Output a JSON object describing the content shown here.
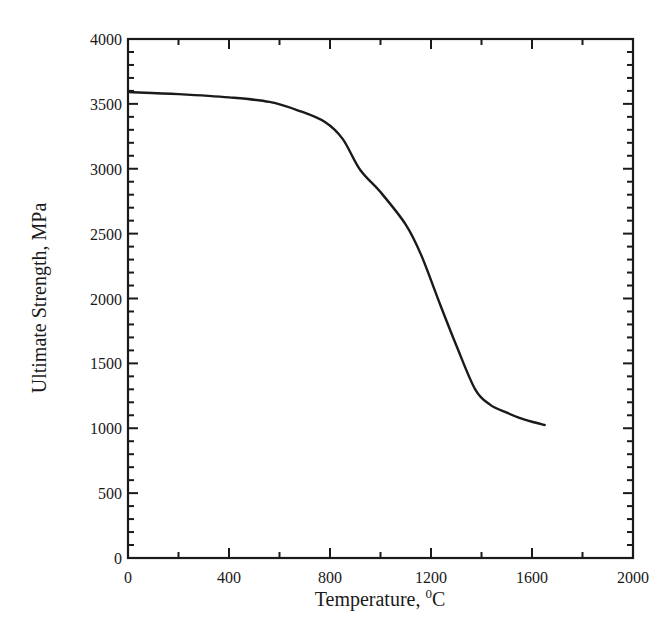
{
  "chart_data": {
    "type": "line",
    "title": "",
    "xlabel": "Temperature, °C",
    "xlabel_main": "Temperature, ",
    "xlabel_sup": "0",
    "xlabel_unit": "C",
    "ylabel": "Ultimate Strength, MPa",
    "xlim": [
      0,
      2000
    ],
    "ylim": [
      0,
      4000
    ],
    "x_ticks": [
      0,
      400,
      800,
      1200,
      1600,
      2000
    ],
    "x_tick_labels": [
      "0",
      "400",
      "800",
      "1200",
      "1600",
      "2000"
    ],
    "x_minor_step": 200,
    "y_ticks": [
      0,
      500,
      1000,
      1500,
      2000,
      2500,
      3000,
      3500,
      4000
    ],
    "y_tick_labels": [
      "0",
      "500",
      "1000",
      "1500",
      "2000",
      "2500",
      "3000",
      "3500",
      "4000"
    ],
    "y_minor_step": 100,
    "grid": false,
    "legend": null,
    "series": [
      {
        "name": "Ultimate Strength",
        "color": "#1a1a1a",
        "x": [
          20,
          200,
          400,
          560,
          680,
          780,
          850,
          920,
          1000,
          1100,
          1160,
          1235,
          1300,
          1375,
          1435,
          1500,
          1550,
          1600,
          1650
        ],
        "y": [
          3590,
          3575,
          3550,
          3515,
          3445,
          3360,
          3230,
          2990,
          2820,
          2570,
          2340,
          1960,
          1640,
          1300,
          1180,
          1120,
          1080,
          1050,
          1025
        ]
      }
    ]
  }
}
